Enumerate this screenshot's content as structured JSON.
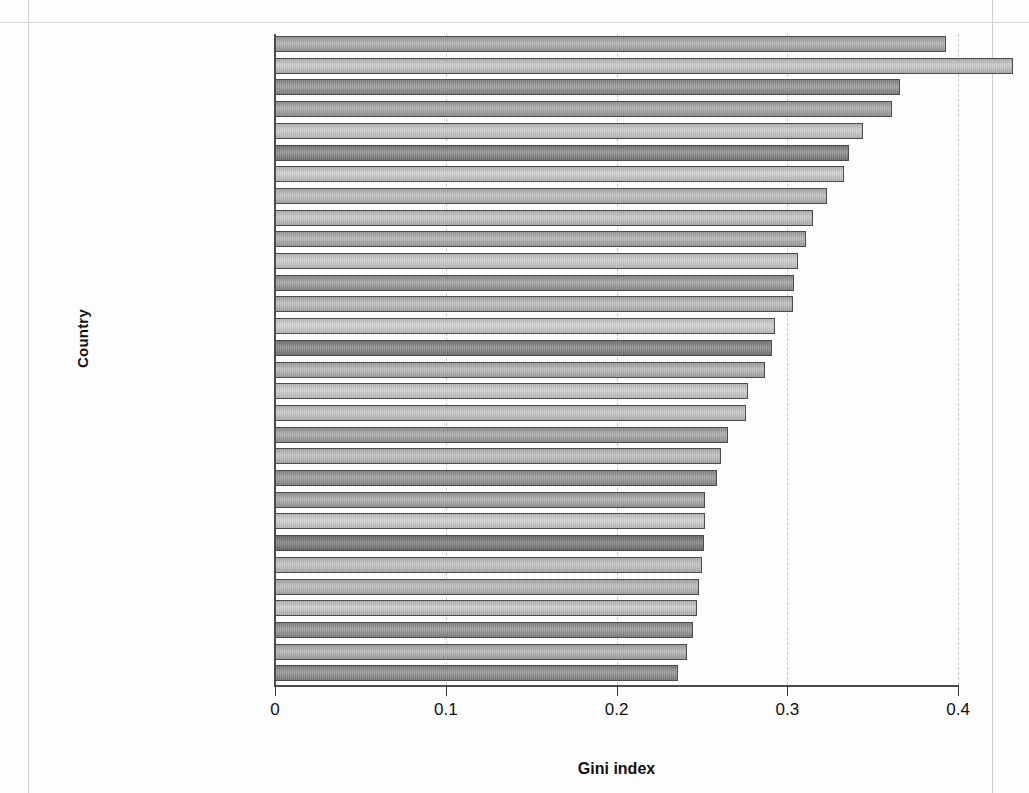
{
  "chart_data": {
    "type": "bar",
    "orientation": "horizontal",
    "title": "",
    "xlabel": "Gini index",
    "ylabel": "Country",
    "xlim": [
      0,
      0.4
    ],
    "xticks": [
      "0",
      "0.1",
      "0.2",
      "0.3",
      "0.4"
    ],
    "xtick_values": [
      0,
      0.1,
      0.2,
      0.3,
      0.4
    ],
    "grid": "vertical dashed at x ticks",
    "legend": "none",
    "highlight_category": "United States",
    "categories": [
      "Mexico",
      "Russia",
      "United States",
      "Estonia",
      "United Kingdom",
      "Israel",
      "Italy",
      "Ireland",
      "Japan",
      "Australia",
      "Switzerland",
      "Canada",
      "Spain",
      "Hungary",
      "Poland",
      "France",
      "Taiwan",
      "Romania",
      "Austria",
      "Luxembourg",
      "Czech Republic",
      "Germany",
      "Sweden",
      "Norway",
      "Belgium",
      "Slovenia",
      "Netherlands",
      "Finland",
      "Slovak Republic",
      "Denmark"
    ],
    "values": [
      0.393,
      0.432,
      0.366,
      0.361,
      0.344,
      0.336,
      0.333,
      0.323,
      0.315,
      0.311,
      0.306,
      0.304,
      0.303,
      0.293,
      0.291,
      0.287,
      0.277,
      0.276,
      0.265,
      0.261,
      0.259,
      0.252,
      0.252,
      0.251,
      0.25,
      0.248,
      0.247,
      0.245,
      0.241,
      0.236
    ],
    "values_label": "Gini index"
  },
  "axis": {
    "x_title": "Gini index",
    "y_title": "Country"
  }
}
